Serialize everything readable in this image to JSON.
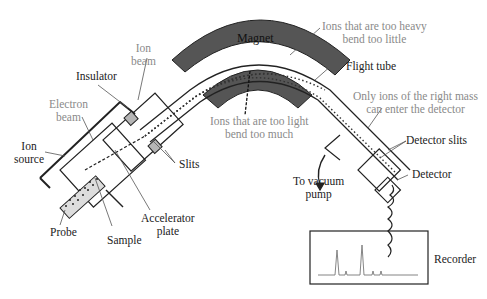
{
  "diagram": {
    "labels": {
      "magnet": "Magnet",
      "ions_heavy_1": "Ions that are too heavy",
      "ions_heavy_2": "bend too little",
      "ion_beam_1": "Ion",
      "ion_beam_2": "beam",
      "insulator": "Insulator",
      "flight_tube": "Flight tube",
      "electron_beam_1": "Electron",
      "electron_beam_2": "beam",
      "ions_light_1": "Ions that are too light",
      "ions_light_2": "bend too much",
      "only_ions_1": "Only ions of the right mass",
      "only_ions_2": "can enter the detector",
      "ion_source_1": "Ion",
      "ion_source_2": "source",
      "slits": "Slits",
      "detector_slits": "Detector slits",
      "detector": "Detector",
      "vacuum_1": "To vacuum",
      "vacuum_2": "pump",
      "accelerator_1": "Accelerator",
      "accelerator_2": "plate",
      "probe": "Probe",
      "sample": "Sample",
      "recorder": "Recorder"
    },
    "colors": {
      "magnet_fill": "#555555",
      "slit_fill": "#b5b5b5",
      "line": "#222222",
      "gray_text": "#8a8a8a"
    }
  }
}
